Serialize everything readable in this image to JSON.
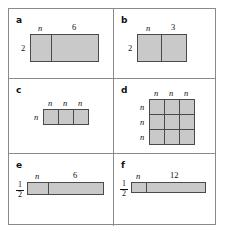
{
  "figure": {
    "background_color": "#ffffff",
    "frame_color": "#8a8a8a",
    "cell_fill_color": "#c9c9c9",
    "cell_border_color": "#4a4a4a"
  },
  "panels": [
    {
      "id": "a",
      "label": "a",
      "kind": "two-part-rectangle",
      "left_label": "2",
      "top_labels": [
        "n",
        "6"
      ],
      "segments": [
        "n",
        "6"
      ]
    },
    {
      "id": "b",
      "label": "b",
      "kind": "two-part-rectangle",
      "left_label": "2",
      "top_labels": [
        "n",
        "3"
      ],
      "segments": [
        "n",
        "3"
      ]
    },
    {
      "id": "c",
      "label": "c",
      "kind": "row-of-squares",
      "left_label": "n",
      "top_labels": [
        "n",
        "n",
        "n"
      ]
    },
    {
      "id": "d",
      "label": "d",
      "kind": "grid-of-squares",
      "left_labels": [
        "n",
        "n",
        "n"
      ],
      "top_labels": [
        "n",
        "n",
        "n"
      ]
    },
    {
      "id": "e",
      "label": "e",
      "kind": "two-part-rectangle",
      "left_fraction": {
        "numerator": "1",
        "denominator": "2"
      },
      "top_labels": [
        "n",
        "6"
      ],
      "segments": [
        "n",
        "6"
      ]
    },
    {
      "id": "f",
      "label": "f",
      "kind": "two-part-rectangle",
      "left_fraction": {
        "numerator": "1",
        "denominator": "2"
      },
      "top_labels": [
        "n",
        "12"
      ],
      "segments": [
        "n",
        "12"
      ]
    }
  ]
}
